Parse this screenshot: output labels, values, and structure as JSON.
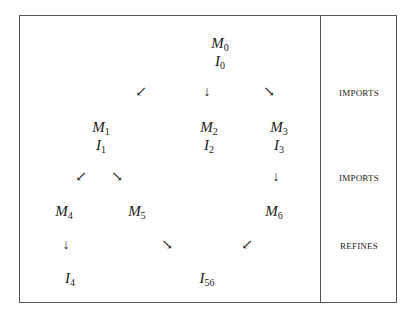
{
  "diagram": {
    "nodes": [
      {
        "id": "M0",
        "base": "M",
        "sub": "0",
        "x": 220,
        "y": 35
      },
      {
        "id": "I0",
        "base": "I",
        "sub": "0",
        "x": 220,
        "y": 53
      },
      {
        "id": "M1",
        "base": "M",
        "sub": "1",
        "x": 101,
        "y": 119
      },
      {
        "id": "I1",
        "base": "I",
        "sub": "1",
        "x": 101,
        "y": 137
      },
      {
        "id": "M2",
        "base": "M",
        "sub": "2",
        "x": 209,
        "y": 119
      },
      {
        "id": "I2",
        "base": "I",
        "sub": "2",
        "x": 209,
        "y": 137
      },
      {
        "id": "M3",
        "base": "M",
        "sub": "3",
        "x": 279,
        "y": 119
      },
      {
        "id": "I3",
        "base": "I",
        "sub": "3",
        "x": 279,
        "y": 137
      },
      {
        "id": "M4",
        "base": "M",
        "sub": "4",
        "x": 64,
        "y": 203
      },
      {
        "id": "M5",
        "base": "M",
        "sub": "5",
        "x": 137,
        "y": 203
      },
      {
        "id": "M6",
        "base": "M",
        "sub": "6",
        "x": 274,
        "y": 203
      },
      {
        "id": "I4",
        "base": "I",
        "sub": "4",
        "x": 70,
        "y": 270
      },
      {
        "id": "I56",
        "base": "I",
        "sub": "56",
        "x": 207,
        "y": 270
      }
    ],
    "arrows": [
      {
        "glyph": "↙",
        "x": 141,
        "y": 85
      },
      {
        "glyph": "↓",
        "x": 207,
        "y": 85
      },
      {
        "glyph": "↘",
        "x": 269,
        "y": 85
      },
      {
        "glyph": "↙",
        "x": 81,
        "y": 170
      },
      {
        "glyph": "↘",
        "x": 117,
        "y": 170
      },
      {
        "glyph": "↓",
        "x": 276,
        "y": 170
      },
      {
        "glyph": "↓",
        "x": 66,
        "y": 238
      },
      {
        "glyph": "↘",
        "x": 167,
        "y": 238
      },
      {
        "glyph": "↙",
        "x": 247,
        "y": 238
      }
    ],
    "row_labels": [
      {
        "text": "IMPORTS",
        "y": 88
      },
      {
        "text": "IMPORTS",
        "y": 173
      },
      {
        "text": "REFINES",
        "y": 241
      }
    ]
  }
}
